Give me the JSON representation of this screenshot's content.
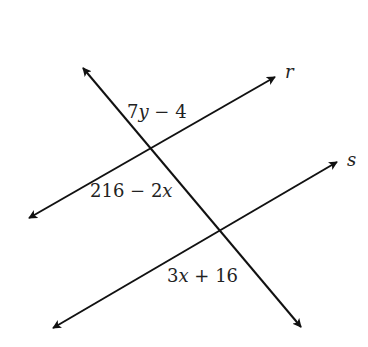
{
  "diagram": {
    "lines": {
      "r": {
        "label": "r",
        "x1": 29,
        "y1": 218,
        "x2": 275,
        "y2": 77
      },
      "s": {
        "label": "s",
        "x1": 53,
        "y1": 328,
        "x2": 337,
        "y2": 162
      },
      "transversal": {
        "x1": 83,
        "y1": 68,
        "x2": 301,
        "y2": 327
      }
    },
    "angles": {
      "top": {
        "coef": "7",
        "var": "y",
        "rest": " − 4"
      },
      "left": {
        "pre": "216 − 2",
        "var": "x"
      },
      "bottom": {
        "coef": "3",
        "var": "x",
        "rest": " + 16"
      }
    },
    "colors": {
      "stroke": "#111111",
      "text": "#222222"
    }
  }
}
